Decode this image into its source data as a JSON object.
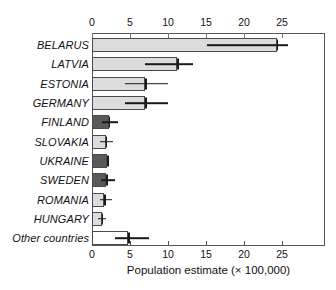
{
  "chart_data": {
    "type": "bar",
    "orientation": "horizontal",
    "title": "",
    "xlabel": "Population estimate (× 100,000)",
    "ylabel": "",
    "xlim": [
      0,
      30.6
    ],
    "xticks": [
      0,
      5,
      10,
      15,
      20,
      25
    ],
    "xtick_labels": [
      "0",
      "5",
      "10",
      "15",
      "20",
      "25"
    ],
    "axis_top": true,
    "axis_bottom": true,
    "grid": false,
    "legend": "none",
    "categories": [
      "BELARUS",
      "LATVIA",
      "ESTONIA",
      "GERMANY",
      "FINLAND",
      "SLOVAKIA",
      "UKRAINE",
      "SWEDEN",
      "ROMANIA",
      "HUNGARY",
      "Other countries"
    ],
    "values": [
      24.3,
      11.2,
      7.0,
      7.0,
      2.2,
      1.8,
      2.0,
      1.9,
      1.6,
      1.3,
      4.8
    ],
    "error_high": [
      25.8,
      13.3,
      10.0,
      10.0,
      3.4,
      2.7,
      2.0,
      3.0,
      2.6,
      1.9,
      7.5
    ],
    "fills": [
      "light",
      "light",
      "light",
      "light",
      "dark",
      "light",
      "dark",
      "dark",
      "light",
      "light",
      "white"
    ],
    "colors": {
      "light": "#dcdcdc",
      "dark": "#5a5a5a",
      "white": "#ffffff",
      "outline": "#4a4a4a",
      "error": "#1a1a1a"
    }
  }
}
